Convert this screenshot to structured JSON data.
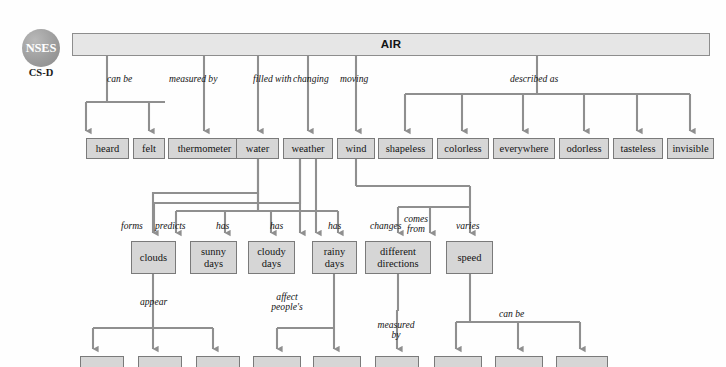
{
  "logo": {
    "name": "NSES",
    "sub": "CS-D"
  },
  "diagram": {
    "type": "concept-map",
    "root": {
      "id": "air",
      "label": "AIR",
      "x": 72,
      "y": 33,
      "w": 638,
      "h": 23
    },
    "nodes": [
      {
        "id": "heard",
        "label": "heard",
        "x": 86,
        "y": 138,
        "w": 43,
        "h": 21
      },
      {
        "id": "felt",
        "label": "felt",
        "x": 133,
        "y": 138,
        "w": 32,
        "h": 21
      },
      {
        "id": "thermometer",
        "label": "thermometer",
        "x": 168,
        "y": 138,
        "w": 73,
        "h": 21
      },
      {
        "id": "water",
        "label": "water",
        "x": 236,
        "y": 138,
        "w": 43,
        "h": 21
      },
      {
        "id": "weather",
        "label": "weather",
        "x": 283,
        "y": 138,
        "w": 50,
        "h": 21
      },
      {
        "id": "wind",
        "label": "wind",
        "x": 337,
        "y": 138,
        "w": 38,
        "h": 21
      },
      {
        "id": "shapeless",
        "label": "shapeless",
        "x": 378,
        "y": 138,
        "w": 55,
        "h": 21
      },
      {
        "id": "colorless",
        "label": "colorless",
        "x": 437,
        "y": 138,
        "w": 52,
        "h": 21
      },
      {
        "id": "everywhere",
        "label": "everywhere",
        "x": 493,
        "y": 138,
        "w": 62,
        "h": 21
      },
      {
        "id": "odorless",
        "label": "odorless",
        "x": 559,
        "y": 138,
        "w": 50,
        "h": 21
      },
      {
        "id": "tasteless",
        "label": "tasteless",
        "x": 613,
        "y": 138,
        "w": 50,
        "h": 21
      },
      {
        "id": "invisible",
        "label": "invisible",
        "x": 667,
        "y": 138,
        "w": 47,
        "h": 21
      },
      {
        "id": "clouds",
        "label": "clouds",
        "x": 131,
        "y": 241,
        "w": 45,
        "h": 33
      },
      {
        "id": "sunnydays",
        "label": "sunny\ndays",
        "x": 190,
        "y": 241,
        "w": 47,
        "h": 33
      },
      {
        "id": "cloudydays",
        "label": "cloudy\ndays",
        "x": 248,
        "y": 241,
        "w": 47,
        "h": 33
      },
      {
        "id": "rainydays",
        "label": "rainy\ndays",
        "x": 312,
        "y": 241,
        "w": 45,
        "h": 33
      },
      {
        "id": "directions",
        "label": "different\ndirections",
        "x": 365,
        "y": 241,
        "w": 66,
        "h": 33
      },
      {
        "id": "speed",
        "label": "speed",
        "x": 446,
        "y": 241,
        "w": 47,
        "h": 33
      },
      {
        "id": "b1",
        "label": "",
        "x": 80,
        "y": 356,
        "w": 44,
        "h": 11
      },
      {
        "id": "b2",
        "label": "",
        "x": 138,
        "y": 356,
        "w": 44,
        "h": 11
      },
      {
        "id": "b3",
        "label": "",
        "x": 196,
        "y": 356,
        "w": 44,
        "h": 11
      },
      {
        "id": "b4",
        "label": "",
        "x": 253,
        "y": 356,
        "w": 48,
        "h": 11
      },
      {
        "id": "b5",
        "label": "",
        "x": 313,
        "y": 356,
        "w": 48,
        "h": 11
      },
      {
        "id": "b6",
        "label": "",
        "x": 375,
        "y": 356,
        "w": 44,
        "h": 11
      },
      {
        "id": "b7",
        "label": "",
        "x": 434,
        "y": 356,
        "w": 48,
        "h": 11
      },
      {
        "id": "b8",
        "label": "",
        "x": 495,
        "y": 356,
        "w": 48,
        "h": 11
      },
      {
        "id": "b9",
        "label": "",
        "x": 556,
        "y": 356,
        "w": 52,
        "h": 11
      }
    ],
    "edge_labels": [
      {
        "id": "can-be-1",
        "text": "can be",
        "x": 107,
        "y": 74,
        "align": "left"
      },
      {
        "id": "measured-by-1",
        "text": "measured by",
        "x": 169,
        "y": 74,
        "align": "left"
      },
      {
        "id": "filled-with",
        "text": "filled with",
        "x": 253,
        "y": 74,
        "align": "left"
      },
      {
        "id": "changing",
        "text": "changing",
        "x": 293,
        "y": 74,
        "align": "left"
      },
      {
        "id": "moving",
        "text": "moving",
        "x": 340,
        "y": 74,
        "align": "left"
      },
      {
        "id": "described-as",
        "text": "described as",
        "x": 510,
        "y": 74,
        "align": "left"
      },
      {
        "id": "forms",
        "text": "forms",
        "x": 121,
        "y": 221,
        "align": "left"
      },
      {
        "id": "predicts",
        "text": "predicts",
        "x": 155,
        "y": 221,
        "align": "left"
      },
      {
        "id": "has-1",
        "text": "has",
        "x": 216,
        "y": 221,
        "align": "left"
      },
      {
        "id": "has-2",
        "text": "has",
        "x": 270,
        "y": 221,
        "align": "left"
      },
      {
        "id": "has-3",
        "text": "has",
        "x": 328,
        "y": 221,
        "align": "left"
      },
      {
        "id": "changes",
        "text": "changes",
        "x": 370,
        "y": 221,
        "align": "left"
      },
      {
        "id": "comes-from",
        "text": "comes\nfrom",
        "x": 416,
        "y": 214,
        "align": "center"
      },
      {
        "id": "varies",
        "text": "varies",
        "x": 456,
        "y": 221,
        "align": "left"
      },
      {
        "id": "appear",
        "text": "appear",
        "x": 140,
        "y": 297,
        "align": "left"
      },
      {
        "id": "affect-peoples",
        "text": "affect\npeople's",
        "x": 287,
        "y": 292,
        "align": "center"
      },
      {
        "id": "measured-by-2",
        "text": "measured\nby",
        "x": 396,
        "y": 320,
        "align": "center"
      },
      {
        "id": "can-be-2",
        "text": "can be",
        "x": 499,
        "y": 309,
        "align": "left"
      }
    ],
    "colors": {
      "node_fill": "#d6d6d6",
      "node_border": "#7a7a7a",
      "title_fill": "#e6e6e6",
      "wire": "#8f8f8f",
      "text": "#131313",
      "badge": "#9d9d9d"
    }
  }
}
